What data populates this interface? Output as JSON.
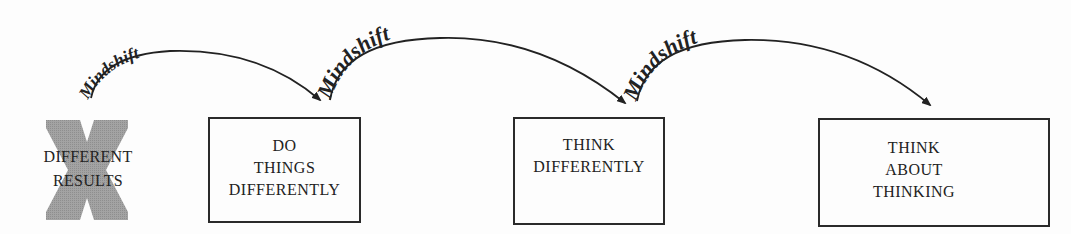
{
  "diagram": {
    "start": {
      "lines": [
        "DIFFERENT",
        "RESULTS"
      ],
      "mark": "X"
    },
    "boxes": [
      {
        "lines": [
          "DO",
          "THINGS",
          "DIFFERENTLY"
        ]
      },
      {
        "lines": [
          "THINK",
          "DIFFERENTLY"
        ]
      },
      {
        "lines": [
          "THINK",
          "ABOUT",
          "THINKING"
        ]
      }
    ],
    "arrows": [
      {
        "label": "Mindshift"
      },
      {
        "label": "Mindshift"
      },
      {
        "label": "Mindshift"
      }
    ],
    "colors": {
      "x_fill": "#9a9a9a",
      "line": "#222222",
      "text": "#222222"
    }
  }
}
